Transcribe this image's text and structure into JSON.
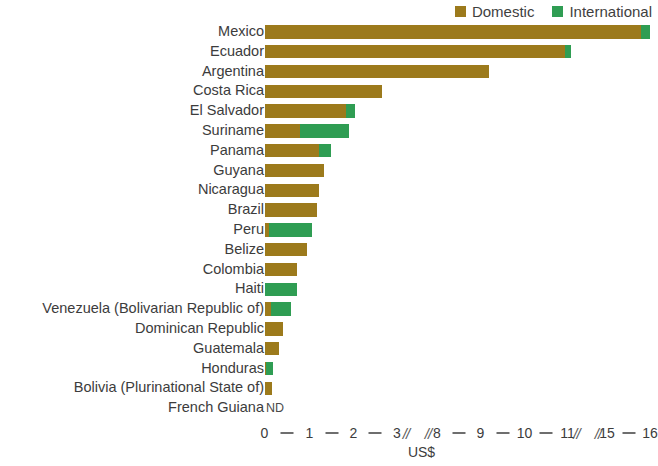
{
  "legend": {
    "entries": [
      {
        "label": "Domestic",
        "color": "#9c7a1c",
        "icon": "square-swatch"
      },
      {
        "label": "International",
        "color": "#2f9d53",
        "icon": "square-swatch"
      }
    ]
  },
  "axis": {
    "title": "US$",
    "tick_labels": [
      "0",
      "1",
      "2",
      "3",
      "8",
      "9",
      "10",
      "11",
      "15",
      "16"
    ],
    "break_marker": "//",
    "no_data_label": "ND"
  },
  "chart_data": {
    "type": "bar",
    "orientation": "horizontal",
    "stacked": true,
    "title": "",
    "xlabel": "US$",
    "ylabel": "",
    "grid": false,
    "legend_position": "top-right",
    "axis_breaks": [
      [
        3,
        8
      ],
      [
        11,
        15
      ]
    ],
    "xticks": [
      0,
      1,
      2,
      3,
      8,
      9,
      10,
      11,
      15,
      16
    ],
    "xlim": [
      0,
      16
    ],
    "categories": [
      "Mexico",
      "Ecuador",
      "Argentina",
      "Costa Rica",
      "El Salvador",
      "Suriname",
      "Panama",
      "Guyana",
      "Nicaragua",
      "Brazil",
      "Peru",
      "Belize",
      "Colombia",
      "Haiti",
      "Venezuela (Bolivarian Republic of)",
      "Dominican Republic",
      "Guatemala",
      "Honduras",
      "Bolivia (Plurinational State of)",
      "French Guiana"
    ],
    "series": [
      {
        "name": "Domestic",
        "color": "#9c7a1c",
        "values": [
          15.8,
          10.95,
          9.2,
          2.65,
          1.82,
          0.78,
          1.22,
          1.32,
          1.22,
          1.18,
          0.1,
          0.95,
          0.72,
          0.02,
          0.14,
          0.4,
          0.33,
          0.04,
          0.17,
          null
        ]
      },
      {
        "name": "International",
        "color": "#2f9d53",
        "values": [
          0.2,
          0.45,
          0.0,
          0.0,
          0.22,
          1.12,
          0.28,
          0.0,
          0.0,
          0.0,
          0.96,
          0.0,
          0.0,
          0.7,
          0.46,
          0.0,
          0.0,
          0.16,
          0.0,
          null
        ]
      }
    ],
    "totals": [
      16.0,
      11.4,
      9.2,
      2.65,
      2.04,
      1.9,
      1.5,
      1.32,
      1.22,
      1.18,
      1.06,
      0.95,
      0.72,
      0.72,
      0.6,
      0.4,
      0.33,
      0.2,
      0.17,
      null
    ],
    "no_data_categories": [
      "French Guiana"
    ]
  }
}
